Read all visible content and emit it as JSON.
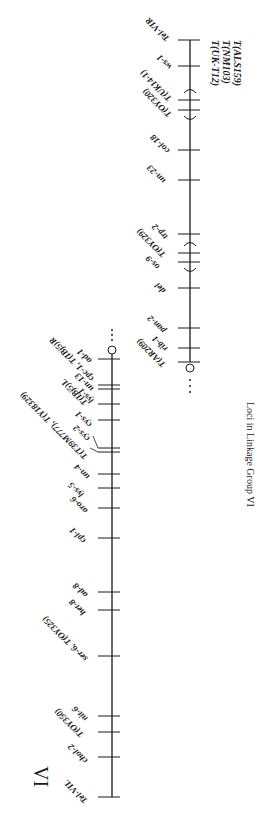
{
  "caption": "Loci in Linkage Group VI",
  "group_numeral": "VI",
  "right_arm": {
    "name": "VIR",
    "axis_x": 190,
    "top_y": 40,
    "bottom_y": 362,
    "terminal_marker": "circle",
    "continuation": "dots",
    "side_translocations": [
      "T(UK-T12)",
      "T(NM103)",
      "T(ALS159)"
    ],
    "loci": [
      {
        "label": "Tel-VIR",
        "y": 40
      },
      {
        "label": "ws-1",
        "y": 66
      },
      {
        "label": "T(UK14-1)",
        "y": 100
      },
      {
        "label": "T(OY320)",
        "y": 110
      },
      {
        "label": "col-18",
        "y": 150
      },
      {
        "label": "un-23",
        "y": 180
      },
      {
        "label": "trp-2",
        "y": 234
      },
      {
        "label": "T(OY329)",
        "y": 253
      },
      {
        "label": "os-9",
        "y": 262
      },
      {
        "label": "del",
        "y": 288
      },
      {
        "label": "pan-2",
        "y": 328
      },
      {
        "label": "rib-1",
        "y": 348
      },
      {
        "label": "T(AR209)",
        "y": 362
      }
    ],
    "brackets": [
      {
        "from": "T(UK14-1)",
        "to": "T(OY320)"
      },
      {
        "from": "T(OY329)",
        "to": "os-9"
      }
    ]
  },
  "left_arm": {
    "name": "VIL",
    "axis_x": 112,
    "top_y": 350,
    "bottom_y": 797,
    "terminal_marker": "circle",
    "continuation": "dots",
    "loci": [
      {
        "label": "ad-1",
        "y": 358
      },
      {
        "label": "cpc-1, T(IBj5)R",
        "y": 358
      },
      {
        "label": "un-13",
        "y": 385
      },
      {
        "label": "T(IBj5)L",
        "y": 389
      },
      {
        "label": "lys-1",
        "y": 393
      },
      {
        "label": "cys-1",
        "y": 404
      },
      {
        "label": "cys-2",
        "y": 447
      },
      {
        "label": "T(T39M777), T(Y18329)",
        "y": 451
      },
      {
        "label": "un-4",
        "y": 474
      },
      {
        "label": "lys-5",
        "y": 488
      },
      {
        "label": "aro-6",
        "y": 508
      },
      {
        "label": "cpl-1",
        "y": 538
      },
      {
        "label": "ad-8",
        "y": 590
      },
      {
        "label": "het-8",
        "y": 608
      },
      {
        "label": "ser-6, T(OY325)",
        "y": 656
      },
      {
        "label": "T(OY350)",
        "y": 710
      },
      {
        "label": "nit-6",
        "y": 716
      },
      {
        "label": "chol-2",
        "y": 757
      },
      {
        "label": "Tel-VIL",
        "y": 797
      }
    ]
  }
}
